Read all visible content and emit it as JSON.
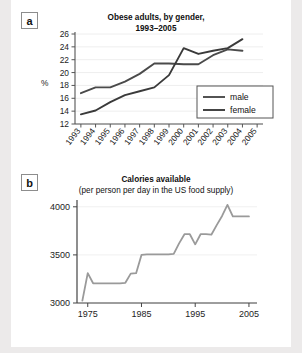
{
  "figure": {
    "background": "#eceaea",
    "paper": "#ffffff"
  },
  "panels": [
    {
      "tag": "a",
      "title": "Obese adults, by gender,",
      "subtitle": "1993–2005"
    },
    {
      "tag": "b",
      "title": "Calories available",
      "subtitle": "(per person per day in the US food supply)"
    }
  ],
  "chart_data": [
    {
      "type": "line",
      "panel": "a",
      "title": "Obese adults, by gender, 1993–2005",
      "xlabel": "",
      "ylabel": "%",
      "x": [
        1993,
        1994,
        1995,
        1996,
        1997,
        1998,
        1999,
        2000,
        2001,
        2002,
        2003,
        2004,
        2005
      ],
      "xlim": [
        1992.6,
        2005.4
      ],
      "ylim": [
        12,
        26
      ],
      "yticks": [
        12,
        14,
        16,
        18,
        20,
        22,
        24,
        26
      ],
      "xticks": [
        "1993",
        "1994",
        "1995",
        "1996",
        "1997",
        "1998",
        "1999",
        "2000",
        "2001",
        "2002",
        "2003",
        "2004",
        "2005"
      ],
      "grid": true,
      "legend_position": "right-middle",
      "series": [
        {
          "name": "male",
          "color": "#4a4a4a",
          "x": [
            1993,
            1994,
            1995,
            1996,
            1997,
            1998,
            1999,
            2000,
            2001,
            2002,
            2003,
            2004
          ],
          "values": [
            16.8,
            17.7,
            17.7,
            18.6,
            19.8,
            21.4,
            21.4,
            21.3,
            21.3,
            22.7,
            23.6,
            23.4
          ]
        },
        {
          "name": "female",
          "color": "#3a3a3a",
          "x": [
            1993,
            1994,
            1995,
            1996,
            1997,
            1998,
            1999,
            2000,
            2001,
            2002,
            2003,
            2004
          ],
          "values": [
            13.5,
            14.1,
            15.4,
            16.5,
            17.1,
            17.7,
            19.6,
            23.8,
            22.9,
            23.4,
            23.8,
            25.2
          ]
        }
      ]
    },
    {
      "type": "line",
      "panel": "b",
      "title": "Calories available (per person per day in the US food supply)",
      "xlabel": "",
      "ylabel": "",
      "xlim": [
        1973,
        2006.5
      ],
      "ylim": [
        3000,
        4050
      ],
      "yticks": [
        3000,
        3500,
        4000
      ],
      "xticks": [
        "1975",
        "1985",
        "1995",
        "2005"
      ],
      "xtickvals": [
        1975,
        1985,
        1995,
        2005
      ],
      "grid": true,
      "series": [
        {
          "name": "calories",
          "color": "#9a9a9a",
          "x": [
            1974,
            1975,
            1976,
            1977,
            1978,
            1979,
            1980,
            1981,
            1982,
            1983,
            1984,
            1985,
            1986,
            1987,
            1988,
            1989,
            1990,
            1991,
            1992,
            1993,
            1994,
            1995,
            1996,
            1997,
            1998,
            1999,
            2000,
            2001,
            2002,
            2003,
            2004,
            2005
          ],
          "values": [
            3025,
            3310,
            3205,
            3205,
            3205,
            3205,
            3205,
            3205,
            3210,
            3305,
            3310,
            3500,
            3505,
            3505,
            3505,
            3505,
            3505,
            3510,
            3620,
            3715,
            3715,
            3610,
            3715,
            3715,
            3710,
            3810,
            3905,
            4020,
            3900,
            3900,
            3900,
            3900
          ]
        }
      ]
    }
  ]
}
